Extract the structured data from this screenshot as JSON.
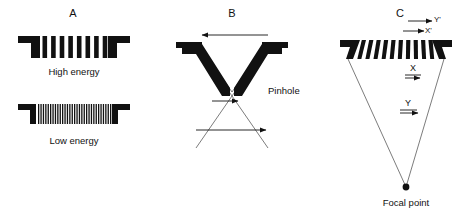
{
  "figure": {
    "background_color": "#ffffff",
    "ink_color": "#111111",
    "ray_color": "#444444"
  },
  "panels": [
    {
      "id": "A",
      "letter": "A",
      "letter_x": 73,
      "letter_y": 14,
      "type": "parallel-hole",
      "collimators": [
        {
          "name": "high-energy-collimator",
          "caption": "High energy",
          "caption_x": 74,
          "caption_y": 72,
          "septa_count": 9,
          "septa_thickness": 4.6,
          "septa_gap": 4.0,
          "body_top": 36,
          "body_bottom": 58,
          "body_left": 18,
          "body_right": 130
        },
        {
          "name": "low-energy-collimator",
          "caption": "Low energy",
          "caption_x": 74,
          "caption_y": 141,
          "septa_count": 31,
          "septa_thickness": 1.3,
          "septa_gap": 2.2,
          "body_top": 104,
          "body_bottom": 124,
          "body_left": 18,
          "body_right": 130
        }
      ]
    },
    {
      "id": "B",
      "letter": "B",
      "letter_x": 232,
      "letter_y": 14,
      "type": "pinhole",
      "pinhole_label": "Pinhole",
      "pinhole_label_x": 268,
      "pinhole_label_y": 91,
      "apex_x": 232,
      "apex_y": 92,
      "top_y": 44,
      "arrows": [
        {
          "name": "object-field-arrow",
          "x1": 268,
          "y1": 35,
          "x2": 200,
          "y2": 35,
          "direction": "left"
        },
        {
          "name": "near-image-arrow",
          "x1": 212,
          "y1": 101,
          "x2": 240,
          "y2": 101,
          "direction": "right"
        },
        {
          "name": "far-image-arrow",
          "x1": 196,
          "y1": 130,
          "x2": 268,
          "y2": 130,
          "direction": "right"
        }
      ]
    },
    {
      "id": "C",
      "letter": "C",
      "letter_x": 400,
      "letter_y": 14,
      "type": "converging",
      "focal_point_label": "Focal point",
      "focal_point_label_x": 406,
      "focal_point_label_y": 203,
      "focal_x": 406,
      "focal_y": 187,
      "septa_count": 11,
      "body_top": 40,
      "body_bottom": 59,
      "body_left": 340,
      "body_right": 452,
      "labels": [
        {
          "name": "label-y-prime",
          "text": "Y'",
          "x": 435,
          "y": 21
        },
        {
          "name": "label-x-prime",
          "text": "X'",
          "x": 427,
          "y": 31
        },
        {
          "name": "label-x",
          "text": "X",
          "x": 413,
          "y": 69
        },
        {
          "name": "label-y",
          "text": "Y",
          "x": 408,
          "y": 104
        }
      ],
      "arrows": [
        {
          "name": "y-prime-arrow",
          "x1": 408,
          "y1": 21,
          "x2": 434,
          "y2": 21
        },
        {
          "name": "x-prime-arrow",
          "x1": 403,
          "y1": 31,
          "x2": 426,
          "y2": 31
        },
        {
          "name": "x-arrow",
          "x1": 405,
          "y1": 76,
          "x2": 421,
          "y2": 76
        },
        {
          "name": "y-arrow",
          "x1": 400,
          "y1": 111,
          "x2": 419,
          "y2": 111
        }
      ]
    }
  ]
}
